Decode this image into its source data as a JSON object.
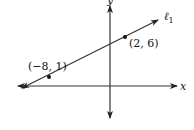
{
  "diagram": {
    "type": "coordinate-plane-line",
    "axes": {
      "x_label": "x",
      "y_label": "y"
    },
    "line": {
      "name": "ℓ",
      "subscript": "1"
    },
    "points": [
      {
        "label": "(−8, 1)",
        "x": -8,
        "y": 1
      },
      {
        "label": "(2, 6)",
        "x": 2,
        "y": 6
      }
    ],
    "colors": {
      "stroke": "#222222",
      "background": "#ffffff"
    }
  }
}
